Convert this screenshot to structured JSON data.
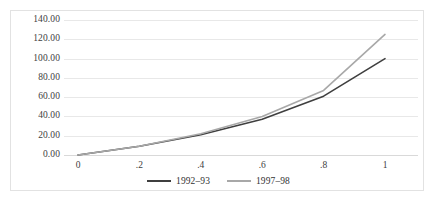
{
  "chart_data": {
    "type": "line",
    "title": "",
    "subtitle": "",
    "xlabel": "",
    "ylabel": "",
    "xlim": [
      0,
      1
    ],
    "ylim": [
      0,
      140
    ],
    "grid": "horizontal",
    "legend_position": "bottom-center",
    "x": [
      0,
      0.2,
      0.4,
      0.6,
      0.8,
      1
    ],
    "y_ticks": [
      0,
      20,
      40,
      60,
      80,
      100,
      120,
      140
    ],
    "y_tick_labels": [
      "0.00",
      "20.00",
      "40.00",
      "60.00",
      "80.00",
      "100.00",
      "120.00",
      "140.00"
    ],
    "x_tick_labels": [
      "0",
      ".2",
      ".4",
      ".6",
      ".8",
      "1"
    ],
    "series": [
      {
        "name": "1992–93",
        "color": "#3f3f3f",
        "values": [
          0,
          9,
          21,
          37,
          61,
          100
        ]
      },
      {
        "name": "1997–98",
        "color": "#a8a8a8",
        "values": [
          0,
          9,
          22,
          40,
          67,
          125
        ]
      }
    ]
  },
  "legend": {
    "entries": [
      {
        "label": "1992–93",
        "color": "#3f3f3f"
      },
      {
        "label": "1997–98",
        "color": "#a8a8a8"
      }
    ]
  }
}
